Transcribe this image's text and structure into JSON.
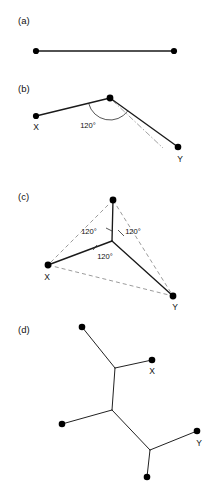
{
  "figure": {
    "background_color": "#ffffff",
    "ink_color": "#1a1a1a",
    "dash_color": "#7a7a7a",
    "width": 212,
    "height": 499,
    "panels": [
      {
        "id": "a",
        "label": "(a)",
        "label_pos": {
          "x": 18,
          "y": 24
        },
        "description": "Two terminals joined by a single straight segment",
        "nodes": [
          {
            "name": "left-terminal",
            "x": 36,
            "y": 51,
            "r": 3.1,
            "label": ""
          },
          {
            "name": "right-terminal",
            "x": 174,
            "y": 51,
            "r": 3.1,
            "label": ""
          }
        ],
        "solid_edges": [
          {
            "x1": 36,
            "y1": 51,
            "x2": 174,
            "y2": 51
          }
        ],
        "dashed_edges": [],
        "dashdot_edges": [],
        "angle_arcs": [],
        "angle_labels": [],
        "point_labels": []
      },
      {
        "id": "b",
        "label": "(b)",
        "label_pos": {
          "x": 18,
          "y": 92
        },
        "description": "Two terminals X and Y joined through a bent path meeting at 120 degrees",
        "nodes": [
          {
            "name": "terminal-x",
            "x": 36,
            "y": 116,
            "r": 3.1,
            "label": "X"
          },
          {
            "name": "steiner-vertex",
            "x": 110,
            "y": 98,
            "r": 3.4,
            "label": ""
          },
          {
            "name": "terminal-y",
            "x": 178,
            "y": 147,
            "r": 3.3,
            "label": "Y"
          }
        ],
        "solid_edges": [
          {
            "x1": 36,
            "y1": 116,
            "x2": 110,
            "y2": 98
          },
          {
            "x1": 110,
            "y1": 98,
            "x2": 178,
            "y2": 147
          }
        ],
        "dashed_edges": [],
        "dashdot_edges": [
          {
            "x1": 112,
            "y1": 100,
            "x2": 163,
            "y2": 148
          }
        ],
        "angle_arcs": [
          {
            "cx": 110,
            "cy": 98,
            "r": 22,
            "start_deg": 166,
            "end_deg": 36
          }
        ],
        "angle_labels": [
          {
            "text": "120°",
            "x": 88,
            "y": 128,
            "anchor": "middle"
          }
        ],
        "point_labels": [
          {
            "text": "X",
            "x": 36,
            "y": 130,
            "anchor": "middle"
          },
          {
            "text": "Y",
            "x": 180,
            "y": 162,
            "anchor": "middle"
          }
        ]
      },
      {
        "id": "c",
        "label": "(c)",
        "label_pos": {
          "x": 18,
          "y": 200
        },
        "description": "Three terminals joined to a central Steiner point with three 120 degree angles",
        "nodes": [
          {
            "name": "terminal-top",
            "x": 113,
            "y": 200,
            "r": 3.4,
            "label": ""
          },
          {
            "name": "steiner-point",
            "x": 112,
            "y": 241,
            "r": 1.0,
            "label": ""
          },
          {
            "name": "terminal-x",
            "x": 48,
            "y": 265,
            "r": 3.4,
            "label": "X"
          },
          {
            "name": "terminal-y",
            "x": 173,
            "y": 296,
            "r": 3.4,
            "label": "Y"
          }
        ],
        "solid_edges": [
          {
            "x1": 113,
            "y1": 200,
            "x2": 112,
            "y2": 241
          },
          {
            "x1": 112,
            "y1": 241,
            "x2": 48,
            "y2": 265
          },
          {
            "x1": 112,
            "y1": 241,
            "x2": 173,
            "y2": 296
          }
        ],
        "dashed_edges": [
          {
            "x1": 113,
            "y1": 200,
            "x2": 48,
            "y2": 265
          },
          {
            "x1": 113,
            "y1": 200,
            "x2": 173,
            "y2": 296
          },
          {
            "x1": 48,
            "y1": 265,
            "x2": 173,
            "y2": 296
          }
        ],
        "dashdot_edges": [],
        "angle_arcs": [],
        "angle_ticks": [
          {
            "x1": 106,
            "y1": 228,
            "x2": 112,
            "y2": 231
          },
          {
            "x1": 118,
            "y1": 230,
            "x2": 124,
            "y2": 236
          },
          {
            "x1": 93,
            "y1": 250,
            "x2": 97,
            "y2": 245
          }
        ],
        "angle_labels": [
          {
            "text": "120°",
            "x": 89,
            "y": 234,
            "anchor": "middle"
          },
          {
            "text": "120°",
            "x": 133,
            "y": 234,
            "anchor": "middle"
          },
          {
            "text": "120°",
            "x": 105,
            "y": 259,
            "anchor": "middle"
          }
        ],
        "point_labels": [
          {
            "text": "X",
            "x": 47,
            "y": 280,
            "anchor": "middle"
          },
          {
            "text": "Y",
            "x": 175,
            "y": 310,
            "anchor": "middle"
          }
        ]
      },
      {
        "id": "d",
        "label": "(d)",
        "label_pos": {
          "x": 18,
          "y": 333
        },
        "description": "Full Steiner topology on five terminals with three Steiner points",
        "nodes": [
          {
            "name": "terminal-upper-left",
            "x": 82,
            "y": 327,
            "r": 3.3,
            "label": ""
          },
          {
            "name": "steiner-point-1",
            "x": 115,
            "y": 368,
            "r": 1.0,
            "label": ""
          },
          {
            "name": "terminal-x",
            "x": 152,
            "y": 360,
            "r": 3.3,
            "label": "X"
          },
          {
            "name": "steiner-point-2",
            "x": 112,
            "y": 410,
            "r": 1.0,
            "label": ""
          },
          {
            "name": "terminal-left",
            "x": 62,
            "y": 424,
            "r": 3.3,
            "label": ""
          },
          {
            "name": "steiner-point-3",
            "x": 150,
            "y": 450,
            "r": 1.0,
            "label": ""
          },
          {
            "name": "terminal-y",
            "x": 197,
            "y": 431,
            "r": 3.3,
            "label": "Y"
          },
          {
            "name": "terminal-bottom",
            "x": 147,
            "y": 477,
            "r": 3.3,
            "label": ""
          }
        ],
        "solid_edges": [
          {
            "x1": 82,
            "y1": 327,
            "x2": 115,
            "y2": 368
          },
          {
            "x1": 115,
            "y1": 368,
            "x2": 152,
            "y2": 360
          },
          {
            "x1": 115,
            "y1": 368,
            "x2": 112,
            "y2": 410
          },
          {
            "x1": 112,
            "y1": 410,
            "x2": 62,
            "y2": 424
          },
          {
            "x1": 112,
            "y1": 410,
            "x2": 150,
            "y2": 450
          },
          {
            "x1": 150,
            "y1": 450,
            "x2": 197,
            "y2": 431
          },
          {
            "x1": 150,
            "y1": 450,
            "x2": 147,
            "y2": 477
          }
        ],
        "dashed_edges": [],
        "dashdot_edges": [],
        "angle_arcs": [],
        "angle_labels": [],
        "point_labels": [
          {
            "text": "X",
            "x": 152,
            "y": 374,
            "anchor": "middle"
          },
          {
            "text": "Y",
            "x": 199,
            "y": 446,
            "anchor": "middle"
          }
        ]
      }
    ]
  }
}
